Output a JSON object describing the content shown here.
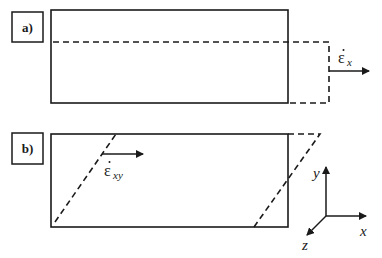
{
  "panels": [
    {
      "label": "a)",
      "description": "uniaxial strain rate: rectangle elongated in x (dashed outline)",
      "rate_symbol": "ε",
      "rate_subscript": "x"
    },
    {
      "label": "b)",
      "description": "shear strain rate: rectangle sheared into parallelogram (dashed outline)",
      "rate_symbol": "ε",
      "rate_subscript": "xy"
    }
  ],
  "axes": {
    "x": "x",
    "y": "y",
    "z": "z"
  },
  "colors": {
    "stroke": "#1a1a1a",
    "background": "#ffffff"
  }
}
